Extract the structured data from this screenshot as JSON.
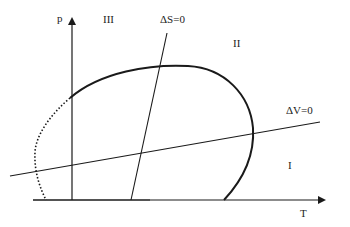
{
  "diagram": {
    "axes": {
      "y_label": "p",
      "x_label": "T"
    },
    "regions": {
      "region_1": "I",
      "region_2": "II",
      "region_3": "III"
    },
    "lines": {
      "delta_s": "ΔS=0",
      "delta_v": "ΔV=0"
    },
    "colors": {
      "stroke": "#1a1a1a",
      "text": "#222222"
    }
  }
}
